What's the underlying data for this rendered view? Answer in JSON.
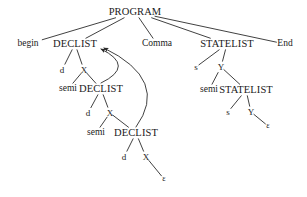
{
  "diagram": {
    "type": "parse-tree",
    "stroke_color": "#2b2b2b",
    "text_color": "#1a1a1a",
    "background": "#ffffff",
    "nodes": [
      {
        "id": "program",
        "label": "PROGRAM",
        "x": 135,
        "y": 12,
        "kind": "nonterminal"
      },
      {
        "id": "begin",
        "label": "begin",
        "x": 28,
        "y": 44,
        "kind": "terminal"
      },
      {
        "id": "declist1",
        "label": "DECLIST",
        "x": 75,
        "y": 44,
        "kind": "nonterminal"
      },
      {
        "id": "comma",
        "label": "Comma",
        "x": 157,
        "y": 44,
        "kind": "terminal"
      },
      {
        "id": "statelist1",
        "label": "STATELIST",
        "x": 227,
        "y": 44,
        "kind": "nonterminal"
      },
      {
        "id": "end",
        "label": "End",
        "x": 285,
        "y": 44,
        "kind": "terminal"
      },
      {
        "id": "d1",
        "label": "d",
        "x": 62,
        "y": 70,
        "kind": "terminal"
      },
      {
        "id": "x1",
        "label": "X",
        "x": 84,
        "y": 70,
        "kind": "nonterminal"
      },
      {
        "id": "semi1",
        "label": "semi",
        "x": 68,
        "y": 89,
        "kind": "terminal"
      },
      {
        "id": "declist2",
        "label": "DECLIST",
        "x": 101,
        "y": 89,
        "kind": "nonterminal"
      },
      {
        "id": "d2",
        "label": "d",
        "x": 88,
        "y": 113,
        "kind": "terminal"
      },
      {
        "id": "x2",
        "label": "X",
        "x": 110,
        "y": 113,
        "kind": "nonterminal"
      },
      {
        "id": "semi2",
        "label": "semi",
        "x": 96,
        "y": 133,
        "kind": "terminal"
      },
      {
        "id": "declist3",
        "label": "DECLIST",
        "x": 136,
        "y": 133,
        "kind": "nonterminal"
      },
      {
        "id": "d3",
        "label": "d",
        "x": 124,
        "y": 157,
        "kind": "terminal"
      },
      {
        "id": "x3",
        "label": "X",
        "x": 146,
        "y": 157,
        "kind": "nonterminal"
      },
      {
        "id": "eps1",
        "label": "ε",
        "x": 164,
        "y": 179,
        "kind": "epsilon"
      },
      {
        "id": "s1",
        "label": "s",
        "x": 196,
        "y": 67,
        "kind": "terminal"
      },
      {
        "id": "y1",
        "label": "Y",
        "x": 221,
        "y": 67,
        "kind": "nonterminal"
      },
      {
        "id": "semi3",
        "label": "semi",
        "x": 209,
        "y": 90,
        "kind": "terminal"
      },
      {
        "id": "statelist2",
        "label": "STATELIST",
        "x": 246,
        "y": 90,
        "kind": "nonterminal"
      },
      {
        "id": "s2",
        "label": "s",
        "x": 228,
        "y": 112,
        "kind": "terminal"
      },
      {
        "id": "y2",
        "label": "Y",
        "x": 251,
        "y": 112,
        "kind": "nonterminal"
      },
      {
        "id": "eps2",
        "label": "ε",
        "x": 268,
        "y": 126,
        "kind": "epsilon"
      }
    ],
    "edges": [
      {
        "from": "program",
        "to": "begin"
      },
      {
        "from": "program",
        "to": "declist1"
      },
      {
        "from": "program",
        "to": "comma"
      },
      {
        "from": "program",
        "to": "statelist1"
      },
      {
        "from": "program",
        "to": "end"
      },
      {
        "from": "declist1",
        "to": "d1"
      },
      {
        "from": "declist1",
        "to": "x1"
      },
      {
        "from": "x1",
        "to": "semi1"
      },
      {
        "from": "x1",
        "to": "declist2"
      },
      {
        "from": "declist2",
        "to": "d2"
      },
      {
        "from": "declist2",
        "to": "x2"
      },
      {
        "from": "x2",
        "to": "semi2"
      },
      {
        "from": "x2",
        "to": "declist3"
      },
      {
        "from": "declist3",
        "to": "d3"
      },
      {
        "from": "declist3",
        "to": "x3"
      },
      {
        "from": "x3",
        "to": "eps1"
      },
      {
        "from": "statelist1",
        "to": "s1"
      },
      {
        "from": "statelist1",
        "to": "y1"
      },
      {
        "from": "y1",
        "to": "semi3"
      },
      {
        "from": "y1",
        "to": "statelist2"
      },
      {
        "from": "statelist2",
        "to": "s2"
      },
      {
        "from": "statelist2",
        "to": "y2"
      },
      {
        "from": "y2",
        "to": "eps2"
      }
    ],
    "back_arrows": [
      {
        "from": "declist2",
        "to": "declist1",
        "label": ""
      },
      {
        "from": "declist3",
        "to": "declist1",
        "label": ""
      }
    ]
  }
}
